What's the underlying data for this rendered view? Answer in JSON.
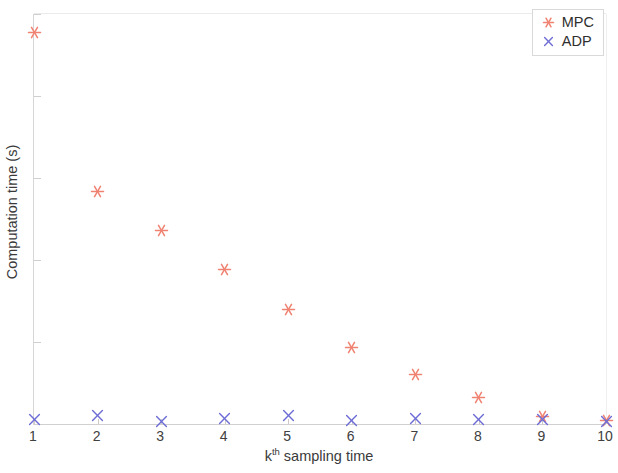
{
  "chart_data": {
    "type": "scatter",
    "title": "",
    "xlabel_prefix": "k",
    "xlabel_sup": "th",
    "xlabel_suffix": " sampling time",
    "xlabel": "k^th sampling time",
    "ylabel": "Computation time (s)",
    "xlim": [
      1,
      10
    ],
    "ylim": [
      0,
      25
    ],
    "xticks": [
      1,
      2,
      3,
      4,
      5,
      6,
      7,
      8,
      9,
      10
    ],
    "xtick_labels": [
      "1",
      "2",
      "3",
      "4",
      "5",
      "6",
      "7",
      "8",
      "9",
      "10"
    ],
    "yticks": [
      0,
      5,
      10,
      15,
      20,
      25
    ],
    "ytick_labels": [
      "0",
      "5",
      "10",
      "15",
      "20",
      "25"
    ],
    "grid": false,
    "legend_position": "top-right",
    "x": [
      1,
      2,
      3,
      4,
      5,
      6,
      7,
      8,
      9,
      10
    ],
    "series": [
      {
        "name": "MPC",
        "marker": "asterisk",
        "color": "#F08272",
        "values": [
          23.9,
          14.2,
          11.8,
          9.4,
          7.0,
          4.65,
          3.0,
          1.6,
          0.45,
          0.2
        ]
      },
      {
        "name": "ADP",
        "marker": "cross",
        "color": "#6C6CD4",
        "values": [
          0.3,
          0.5,
          0.15,
          0.35,
          0.5,
          0.2,
          0.35,
          0.3,
          0.3,
          0.15
        ]
      }
    ]
  },
  "legend": {
    "entries": [
      {
        "label": "MPC"
      },
      {
        "label": "ADP"
      }
    ]
  },
  "colors": {
    "mpc": "#F08272",
    "adp": "#6C6CD4",
    "axis": "#d2cfd0",
    "text": "#3a3a3a",
    "background": "#ffffff"
  }
}
